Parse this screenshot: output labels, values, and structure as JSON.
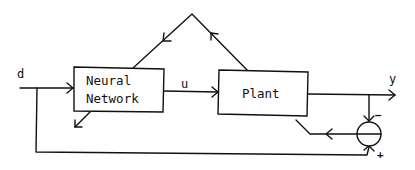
{
  "diagram": {
    "type": "block-diagram",
    "blocks": [
      {
        "id": "neural-network",
        "line1": "Neural",
        "line2": "Network"
      },
      {
        "id": "plant",
        "label": "Plant"
      }
    ],
    "signals": {
      "input": "d",
      "control": "u",
      "output": "y"
    },
    "summing_junction": {
      "minus_sign": "−",
      "plus_sign": "+"
    },
    "connections": [
      {
        "from": "d",
        "to": "neural-network"
      },
      {
        "from": "neural-network",
        "to": "plant",
        "label": "u"
      },
      {
        "from": "plant",
        "to": "y"
      },
      {
        "from": "y",
        "to": "summing-junction",
        "sign": "-"
      },
      {
        "from": "d",
        "to": "summing-junction",
        "sign": "+"
      },
      {
        "from": "summing-junction",
        "to": "plant (error path)"
      },
      {
        "from": "plant",
        "to": "neural-network (via triangle feedback path)"
      }
    ],
    "colors": {
      "line": "#111111",
      "background": "#ffffff"
    }
  }
}
